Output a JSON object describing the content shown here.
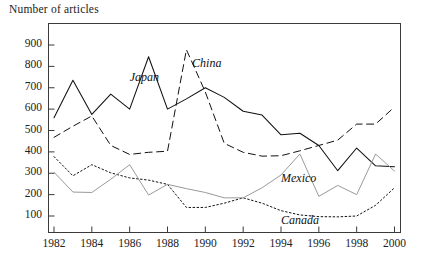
{
  "chart_data": {
    "type": "line",
    "title": "",
    "subtitle": "",
    "ylabel": "Number of articles",
    "xlabel": "",
    "grid": false,
    "legend_position": "inline-annotations",
    "x": [
      1982,
      1983,
      1984,
      1985,
      1986,
      1987,
      1988,
      1989,
      1990,
      1991,
      1992,
      1993,
      1994,
      1995,
      1996,
      1997,
      1998,
      1999,
      2000
    ],
    "xlim": [
      1982,
      2000
    ],
    "ylim": [
      0,
      950
    ],
    "xticks": [
      "1982",
      "1984",
      "1986",
      "1988",
      "1990",
      "1992",
      "1994",
      "1996",
      "1998",
      "2000"
    ],
    "yticks": [
      "100",
      "200",
      "300",
      "400",
      "500",
      "600",
      "700",
      "800",
      "900"
    ],
    "series": [
      {
        "name": "Japan",
        "style": "solid",
        "color": "#111111",
        "values": [
          560,
          735,
          575,
          670,
          600,
          845,
          600,
          648,
          700,
          655,
          590,
          572,
          480,
          487,
          430,
          312,
          418,
          335,
          330
        ]
      },
      {
        "name": "China",
        "style": "dashed",
        "color": "#111111",
        "values": [
          468,
          520,
          568,
          430,
          388,
          398,
          403,
          878,
          680,
          440,
          398,
          380,
          382,
          405,
          430,
          455,
          530,
          530,
          610
        ]
      },
      {
        "name": "Canada",
        "style": "dotted",
        "color": "#111111",
        "values": [
          378,
          288,
          340,
          302,
          278,
          268,
          248,
          140,
          140,
          160,
          185,
          160,
          125,
          105,
          97,
          96,
          100,
          150,
          232
        ]
      },
      {
        "name": "Mexico",
        "style": "solid",
        "color": "#9a9a9a",
        "values": [
          305,
          212,
          210,
          272,
          340,
          198,
          248,
          228,
          210,
          185,
          185,
          232,
          292,
          390,
          192,
          243,
          200,
          390,
          310
        ]
      }
    ],
    "annotations": [
      {
        "text": "Japan",
        "x": 1986.0,
        "y": 745
      },
      {
        "text": "China",
        "x": 1989.3,
        "y": 812
      },
      {
        "text": "Mexico",
        "x": 1994.0,
        "y": 272
      },
      {
        "text": "Canada",
        "x": 1994.0,
        "y": 78
      }
    ]
  }
}
